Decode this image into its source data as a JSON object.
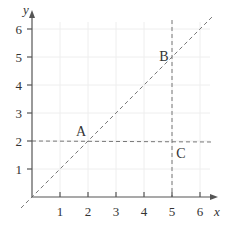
{
  "diagram": {
    "type": "coordinate-plane",
    "axes": {
      "x_label": "x",
      "y_label": "y",
      "x_ticks": [
        "1",
        "2",
        "3",
        "4",
        "5",
        "6"
      ],
      "y_ticks": [
        "1",
        "2",
        "3",
        "4",
        "5",
        "6"
      ],
      "origin": [
        0,
        0
      ],
      "range": {
        "x": [
          0,
          6
        ],
        "y": [
          0,
          6
        ]
      }
    },
    "lines": [
      {
        "name": "y = x",
        "style": "dashed",
        "from": [
          -0.4,
          -0.4
        ],
        "to": [
          6.4,
          6.4
        ]
      },
      {
        "name": "y = 2",
        "style": "dashed",
        "from": [
          0,
          2
        ],
        "to": [
          6.4,
          2
        ]
      },
      {
        "name": "x = 5",
        "style": "dashed",
        "from": [
          5,
          0
        ],
        "to": [
          5,
          6.3
        ]
      }
    ],
    "points": [
      {
        "label": "A",
        "coords": [
          2,
          2
        ]
      },
      {
        "label": "B",
        "coords": [
          5,
          5
        ]
      },
      {
        "label": "C",
        "coords": [
          5,
          2
        ]
      }
    ],
    "colors": {
      "axis": "#555555",
      "dashed": "#777777",
      "grid": "#eeeeee",
      "text": "#333333"
    }
  }
}
